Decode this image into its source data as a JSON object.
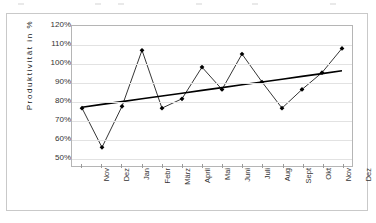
{
  "chart_data": {
    "type": "line",
    "title": "",
    "xlabel": "",
    "ylabel": "Produktivität in %",
    "categories": [
      "Nov",
      "Dez",
      "Jan",
      "Febr",
      "März",
      "April",
      "Mai",
      "Juni",
      "Juli",
      "Aug",
      "Sept",
      "Okt",
      "Nov",
      "Dez"
    ],
    "ylim": [
      45,
      120
    ],
    "ytick_labels": [
      "120%",
      "110%",
      "100%",
      "90%",
      "80%",
      "70%",
      "60%",
      "50%"
    ],
    "ytick_values": [
      120,
      110,
      100,
      90,
      80,
      70,
      60,
      50
    ],
    "grid": true,
    "legend": "none",
    "series": [
      {
        "name": "Produktivität",
        "type": "line",
        "marker": "diamond",
        "color": "#000000",
        "values": [
          76,
          55,
          77,
          107,
          76,
          81,
          98,
          86,
          105,
          90,
          76,
          86,
          95,
          108
        ]
      },
      {
        "name": "Trend",
        "type": "trendline",
        "marker": "none",
        "color": "#000000",
        "values": [
          76.5,
          78.0,
          79.5,
          81.0,
          82.5,
          84.0,
          85.5,
          87.0,
          88.5,
          90.0,
          91.5,
          93.0,
          94.5,
          96.0
        ]
      }
    ]
  }
}
